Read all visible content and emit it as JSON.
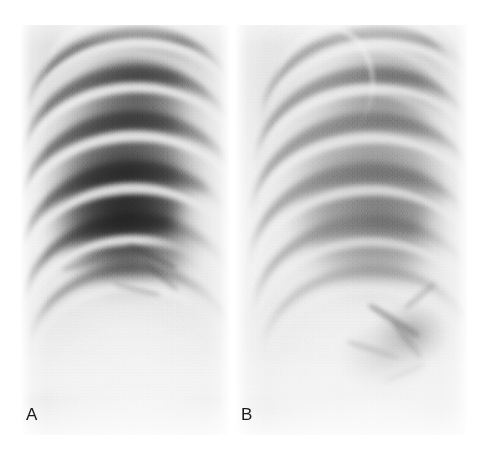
{
  "figure": {
    "kind": "radiograph-figure",
    "modality": "chest radiograph",
    "background_color": "#ffffff",
    "panel_count": 2
  },
  "panels": [
    {
      "id": "panel-a",
      "label": "A",
      "caption": "",
      "findings": "Well-aerated upper and mid lung zones with sharply defined dark intercostal stripes; dense homogeneous opacity occupying the lower zone with loss of the diaphragmatic and costophrenic outline; sharp mediastinal border on the medial side",
      "overall_density": "dark upper zones, dense bright lower zone",
      "bounds": {
        "x": 21,
        "y": 25,
        "width": 208,
        "height": 410
      }
    },
    {
      "id": "panel-b",
      "label": "B",
      "caption": "",
      "findings": "Diffusely hazier lung fields with reduced contrast between ribs and lung; coarse perihilar and basal reticular markings; preserved but indistinct rib shadows; overall increased background opacification compared with A",
      "overall_density": "uniformly hazy, increased opacification",
      "bounds": {
        "x": 236,
        "y": 25,
        "width": 231,
        "height": 410
      }
    }
  ],
  "labels": {
    "panel_a_letter": "A",
    "panel_b_letter": "B",
    "letter_color": "#1a1a1a"
  },
  "colors": {
    "page_background": "#ffffff",
    "film_base_a": "#e4e4e4",
    "film_base_b": "#ebebeb",
    "lung_dark": "#2c2c2c",
    "bone_bright": "#f7f7f7",
    "soft_tissue": "#d2d2d2",
    "label_text": "#1a1a1a"
  }
}
